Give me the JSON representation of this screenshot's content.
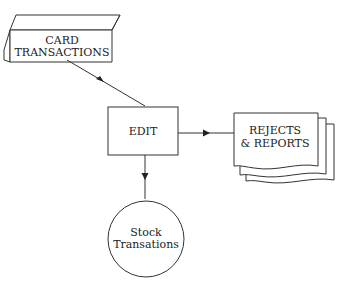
{
  "diagram": {
    "type": "system-flowchart",
    "nodes": [
      {
        "id": "card",
        "shape": "punched-card",
        "lines": [
          "CARD",
          "TRANSACTIONS"
        ]
      },
      {
        "id": "edit",
        "shape": "process-rectangle",
        "lines": [
          "EDIT"
        ]
      },
      {
        "id": "reports",
        "shape": "multi-document",
        "lines": [
          "REJECTS",
          "& REPORTS"
        ]
      },
      {
        "id": "stock",
        "shape": "circle",
        "lines": [
          "Stock",
          "Transations"
        ]
      }
    ],
    "edges": [
      {
        "from": "card",
        "to": "edit"
      },
      {
        "from": "edit",
        "to": "reports"
      },
      {
        "from": "edit",
        "to": "stock"
      }
    ],
    "colors": {
      "stroke": "#333333",
      "background": "#ffffff",
      "text": "#222222"
    }
  }
}
